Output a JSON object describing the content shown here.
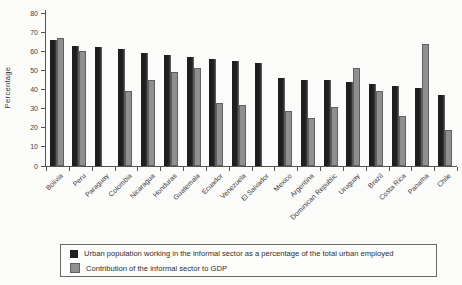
{
  "chart_data": {
    "type": "bar",
    "title": "",
    "xlabel": "",
    "ylabel": "Percentage",
    "ylim": [
      0,
      80
    ],
    "yticks": [
      0,
      10,
      20,
      30,
      40,
      50,
      60,
      70,
      80
    ],
    "grid": false,
    "legend_position": "bottom",
    "categories": [
      "Bolivia",
      "Peru",
      "Paraguay",
      "Colombia",
      "Nicaragua",
      "Honduras",
      "Guatemala",
      "Ecuador",
      "Venezuela",
      "El Salvador",
      "Mexico",
      "Argentina",
      "Dominican Republic",
      "Uruguay",
      "Brazil",
      "Costa Rica",
      "Panama",
      "Chile"
    ],
    "series": [
      {
        "name": "Urban population working in the informal sector as a percentage of the total urban employed",
        "color": "#1e1e1e",
        "values": [
          66,
          63,
          62,
          61,
          59,
          58,
          57,
          56,
          55,
          54,
          46,
          45,
          45,
          44,
          43,
          42,
          41,
          37
        ]
      },
      {
        "name": "Contribution of the informal sector to GDP",
        "color": "#8f8f8f",
        "values": [
          67,
          60,
          null,
          39,
          45,
          49,
          51,
          33,
          32,
          null,
          29,
          25,
          31,
          51,
          39,
          26,
          64,
          19
        ]
      }
    ]
  }
}
